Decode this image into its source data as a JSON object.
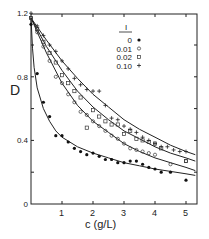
{
  "chart_data": {
    "type": "scatter",
    "title": "",
    "xlabel": "c (g/L)",
    "ylabel": "D",
    "xlim": [
      0,
      5.4
    ],
    "ylim": [
      0,
      1.2
    ],
    "x_ticks": [
      1,
      2,
      3,
      4,
      5
    ],
    "y_ticks": [
      0,
      0.4,
      0.8,
      1.2
    ],
    "y_tick_labels": [
      "0",
      "0.4",
      "0.8",
      "1.2"
    ],
    "grid": false,
    "legend": {
      "title": "I",
      "position": "upper right"
    },
    "series": [
      {
        "name": "0",
        "marker": "filled-circle",
        "points": [
          [
            0.0,
            1.13
          ],
          [
            0.2,
            0.82
          ],
          [
            0.4,
            0.64
          ],
          [
            0.6,
            0.55
          ],
          [
            0.8,
            0.43
          ],
          [
            1.0,
            0.43
          ],
          [
            1.2,
            0.39
          ],
          [
            1.4,
            0.35
          ],
          [
            1.6,
            0.33
          ],
          [
            1.8,
            0.31
          ],
          [
            2.0,
            0.32
          ],
          [
            2.2,
            0.3
          ],
          [
            2.4,
            0.28
          ],
          [
            2.6,
            0.28
          ],
          [
            2.8,
            0.26
          ],
          [
            3.0,
            0.26
          ],
          [
            3.2,
            0.27
          ],
          [
            3.4,
            0.27
          ],
          [
            3.6,
            0.25
          ],
          [
            3.8,
            0.23
          ],
          [
            4.0,
            0.22
          ],
          [
            4.2,
            0.2
          ],
          [
            4.5,
            0.2
          ],
          [
            5.0,
            0.15
          ]
        ],
        "fit": [
          [
            0.0,
            1.17
          ],
          [
            0.05,
            0.98
          ],
          [
            0.1,
            0.86
          ],
          [
            0.2,
            0.73
          ],
          [
            0.4,
            0.6
          ],
          [
            0.6,
            0.52
          ],
          [
            0.8,
            0.46
          ],
          [
            1.0,
            0.42
          ],
          [
            1.5,
            0.36
          ],
          [
            2.0,
            0.32
          ],
          [
            2.5,
            0.29
          ],
          [
            3.0,
            0.26
          ],
          [
            3.5,
            0.24
          ],
          [
            4.0,
            0.22
          ],
          [
            4.5,
            0.205
          ],
          [
            5.0,
            0.19
          ],
          [
            5.3,
            0.18
          ]
        ]
      },
      {
        "name": "0.01",
        "marker": "open-circle",
        "points": [
          [
            0.0,
            1.17
          ],
          [
            0.2,
            1.08
          ],
          [
            0.4,
            0.99
          ],
          [
            0.6,
            0.9
          ],
          [
            0.8,
            0.8
          ],
          [
            1.0,
            0.76
          ],
          [
            1.2,
            0.69
          ],
          [
            1.4,
            0.64
          ],
          [
            1.6,
            0.58
          ],
          [
            1.8,
            0.56
          ],
          [
            2.0,
            0.52
          ],
          [
            2.2,
            0.49
          ],
          [
            2.4,
            0.46
          ],
          [
            2.6,
            0.43
          ],
          [
            2.8,
            0.41
          ],
          [
            3.0,
            0.38
          ],
          [
            3.2,
            0.35
          ],
          [
            3.4,
            0.34
          ],
          [
            3.6,
            0.33
          ],
          [
            3.8,
            0.32
          ],
          [
            4.0,
            0.31
          ],
          [
            4.5,
            0.25
          ],
          [
            5.0,
            0.27
          ]
        ],
        "fit": [
          [
            0.0,
            1.17
          ],
          [
            0.5,
            0.95
          ],
          [
            1.0,
            0.76
          ],
          [
            1.5,
            0.62
          ],
          [
            2.0,
            0.52
          ],
          [
            2.5,
            0.45
          ],
          [
            3.0,
            0.38
          ],
          [
            3.5,
            0.33
          ],
          [
            4.0,
            0.29
          ],
          [
            4.5,
            0.26
          ],
          [
            5.0,
            0.23
          ],
          [
            5.3,
            0.21
          ]
        ]
      },
      {
        "name": "0.02",
        "marker": "open-square",
        "points": [
          [
            0.0,
            1.17
          ],
          [
            0.2,
            1.1
          ],
          [
            0.4,
            1.02
          ],
          [
            0.6,
            0.95
          ],
          [
            0.8,
            0.89
          ],
          [
            1.0,
            0.81
          ],
          [
            1.2,
            0.76
          ],
          [
            1.4,
            0.71
          ],
          [
            1.6,
            0.67
          ],
          [
            1.8,
            0.48
          ],
          [
            2.0,
            0.59
          ],
          [
            2.2,
            0.55
          ],
          [
            2.4,
            0.52
          ],
          [
            2.6,
            0.5
          ],
          [
            2.8,
            0.5
          ],
          [
            3.0,
            0.44
          ],
          [
            3.2,
            0.46
          ],
          [
            3.4,
            0.41
          ],
          [
            3.6,
            0.4
          ],
          [
            3.8,
            0.39
          ],
          [
            4.0,
            0.38
          ],
          [
            4.2,
            0.35
          ],
          [
            5.0,
            0.27
          ]
        ],
        "fit": [
          [
            0.0,
            1.17
          ],
          [
            0.5,
            0.99
          ],
          [
            1.0,
            0.84
          ],
          [
            1.5,
            0.71
          ],
          [
            2.0,
            0.61
          ],
          [
            2.5,
            0.53
          ],
          [
            3.0,
            0.46
          ],
          [
            3.5,
            0.41
          ],
          [
            4.0,
            0.36
          ],
          [
            4.5,
            0.32
          ],
          [
            5.0,
            0.29
          ],
          [
            5.3,
            0.27
          ]
        ]
      },
      {
        "name": "0.10",
        "marker": "plus",
        "points": [
          [
            0.0,
            1.2
          ],
          [
            0.2,
            1.12
          ],
          [
            0.4,
            1.06
          ],
          [
            0.6,
            1.0
          ],
          [
            0.8,
            0.96
          ],
          [
            1.0,
            0.9
          ],
          [
            1.2,
            0.85
          ],
          [
            1.4,
            0.79
          ],
          [
            1.6,
            0.75
          ],
          [
            1.8,
            0.72
          ],
          [
            2.0,
            0.71
          ],
          [
            2.2,
            0.71
          ],
          [
            2.4,
            0.62
          ],
          [
            2.6,
            0.54
          ],
          [
            2.8,
            0.53
          ],
          [
            3.0,
            0.49
          ],
          [
            3.2,
            0.47
          ],
          [
            3.4,
            0.45
          ],
          [
            3.6,
            0.42
          ],
          [
            3.8,
            0.4
          ],
          [
            4.0,
            0.38
          ],
          [
            4.2,
            0.36
          ],
          [
            4.4,
            0.36
          ],
          [
            4.6,
            0.34
          ],
          [
            4.8,
            0.33
          ],
          [
            5.0,
            0.33
          ]
        ],
        "fit": [
          [
            0.0,
            1.17
          ],
          [
            0.5,
            1.03
          ],
          [
            1.0,
            0.9
          ],
          [
            1.5,
            0.79
          ],
          [
            2.0,
            0.69
          ],
          [
            2.5,
            0.61
          ],
          [
            3.0,
            0.53
          ],
          [
            3.5,
            0.47
          ],
          [
            4.0,
            0.42
          ],
          [
            4.5,
            0.37
          ],
          [
            5.0,
            0.33
          ],
          [
            5.3,
            0.31
          ]
        ]
      }
    ]
  },
  "labels": {
    "ylabel": "D",
    "xlabel": "c (g/L)",
    "legend_title": "I",
    "legend_entries": [
      "0",
      "0.01",
      "0.02",
      "0.10"
    ],
    "x_ticks": [
      "1",
      "2",
      "3",
      "4",
      "5"
    ],
    "y_ticks": [
      "0",
      "0.4",
      "0.8",
      "1.2"
    ]
  }
}
